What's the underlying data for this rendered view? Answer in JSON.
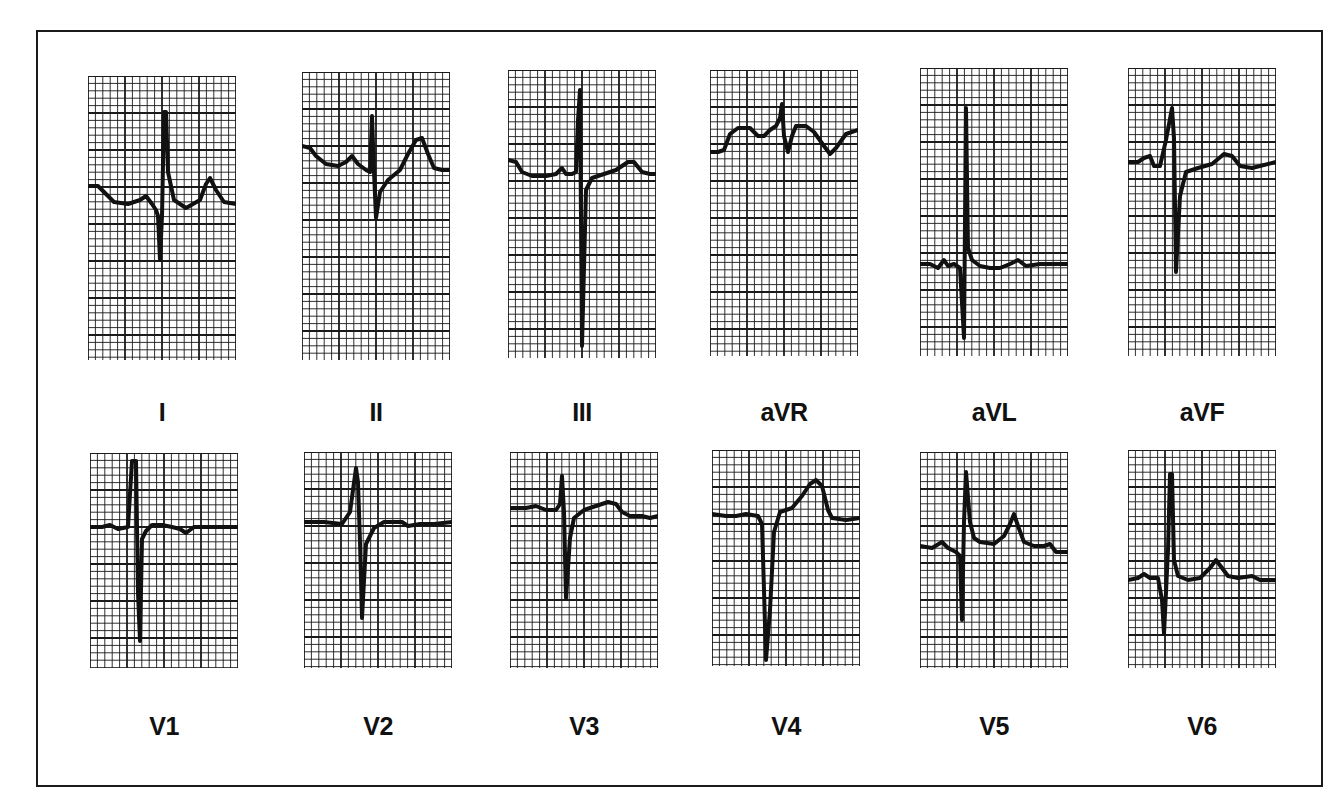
{
  "figure": {
    "rows": [
      {
        "leads": [
          {
            "label": "I",
            "x": 88,
            "y": 76,
            "w": 148,
            "h": 284,
            "baseline": 112,
            "trace": "0,110 10,110 18,118 26,126 40,128 52,124 58,120 64,128 68,134 70,140 72,184 74,140 76,36 78,36 80,96 86,124 98,132 112,124 118,108 122,102 128,114 136,126 148,128"
          },
          {
            "label": "II",
            "x": 302,
            "y": 72,
            "w": 148,
            "h": 288,
            "baseline": 98,
            "trace": "0,74 8,76 14,84 24,92 36,94 44,90 50,84 56,92 64,98 68,100 70,44 72,100 74,146 78,120 86,108 98,98 106,82 114,68 120,66 126,82 132,96 140,98 148,98"
          },
          {
            "label": "III",
            "x": 508,
            "y": 70,
            "w": 148,
            "h": 288,
            "baseline": 100,
            "trace": "0,90 8,92 14,102 24,106 38,106 48,104 54,98 58,104 64,104 68,102 70,50 72,20 74,276 78,120 84,108 96,104 108,100 120,92 126,92 134,102 142,104 148,104"
          },
          {
            "label": "aVR",
            "x": 710,
            "y": 70,
            "w": 148,
            "h": 286,
            "baseline": 80,
            "trace": "0,82 8,82 14,80 20,64 28,58 40,58 48,66 54,66 60,60 66,56 70,48 72,34 74,66 78,82 82,66 86,56 96,56 104,62 114,76 120,84 126,78 136,64 148,60"
          },
          {
            "label": "aVL",
            "x": 920,
            "y": 68,
            "w": 148,
            "h": 288,
            "baseline": 195,
            "trace": "0,196 10,196 18,200 24,192 28,198 34,196 40,200 44,270 46,40 48,180 52,192 60,198 70,200 80,200 90,196 98,192 106,198 120,196 148,196"
          },
          {
            "label": "aVF",
            "x": 1128,
            "y": 68,
            "w": 148,
            "h": 288,
            "baseline": 92,
            "trace": "0,94 10,94 16,90 22,88 26,98 32,98 38,72 44,40 46,70 48,204 52,128 58,104 70,100 84,96 96,86 104,88 112,98 124,100 148,94"
          }
        ]
      },
      {
        "leads": [
          {
            "label": "V1",
            "x": 90,
            "y": 453,
            "w": 148,
            "h": 215,
            "baseline": 74,
            "trace": "0,74 12,74 20,72 28,76 38,74 42,8 46,8 48,140 50,188 52,86 56,78 62,72 72,72 82,74 90,76 96,80 104,74 116,74 130,74 148,74"
          },
          {
            "label": "V2",
            "x": 304,
            "y": 452,
            "w": 148,
            "h": 216,
            "baseline": 70,
            "trace": "0,70 20,70 38,72 46,60 52,16 54,30 56,90 58,166 62,92 70,76 80,70 92,70 98,70 104,74 116,72 130,72 148,70"
          },
          {
            "label": "V3",
            "x": 510,
            "y": 452,
            "w": 148,
            "h": 216,
            "baseline": 56,
            "trace": "0,56 16,56 26,54 36,58 46,58 50,52 52,24 54,60 56,146 60,86 64,66 74,58 86,54 98,50 106,52 112,60 120,64 132,64 140,66 148,64"
          },
          {
            "label": "V4",
            "x": 712,
            "y": 450,
            "w": 148,
            "h": 216,
            "baseline": 66,
            "trace": "0,64 14,66 24,66 34,64 46,66 50,74 52,140 54,210 58,160 62,82 68,62 80,58 90,46 98,34 104,30 110,36 116,60 120,68 134,70 148,68"
          },
          {
            "label": "V5",
            "x": 920,
            "y": 452,
            "w": 148,
            "h": 216,
            "baseline": 94,
            "trace": "0,94 12,96 22,90 28,96 36,100 40,104 42,168 44,70 46,20 50,70 54,86 60,90 74,92 84,84 90,72 94,62 98,74 104,90 114,94 124,94 130,92 136,100 148,100"
          },
          {
            "label": "V6",
            "x": 1128,
            "y": 450,
            "w": 148,
            "h": 218,
            "baseline": 126,
            "trace": "0,130 10,128 16,124 22,128 30,128 34,150 36,184 40,100 42,24 44,24 46,110 50,126 60,130 72,128 82,118 88,110 94,118 100,126 110,128 124,126 132,130 140,130 148,130"
          }
        ]
      }
    ]
  },
  "grid": {
    "minor_px": 7.4,
    "major_every": 5,
    "line_color": "#1a1a1a",
    "trace_color": "#111111"
  },
  "chart_data": {
    "type": "table",
    "leads": [
      "I",
      "II",
      "III",
      "aVR",
      "aVL",
      "aVF",
      "V1",
      "V2",
      "V3",
      "V4",
      "V5",
      "V6"
    ],
    "layout": "2 rows x 6 columns; limb leads on top row, precordial leads on bottom row",
    "grid": "standard ECG paper: small squares with heavier line every 5 squares",
    "qrs_description": {
      "I": "small r, deep narrow S, tall R then upright T",
      "II": "small R, S wave, upright T",
      "III": "tall R followed by very deep S",
      "aVR": "elevated baseline, small notched QRS, inverted T",
      "aVL": "very tall R, small S, low flat baseline",
      "aVF": "R wave then deep S, upright small T",
      "V1": "tall narrow R then deep S, flat T",
      "V2": "small R, deep S, upright T",
      "V3": "small R, deep S, upright T",
      "V4": "deep QS, tall peaked T",
      "V5": "tall R, S wave, upright T",
      "V6": "tall R, small q/s, upright T"
    }
  }
}
